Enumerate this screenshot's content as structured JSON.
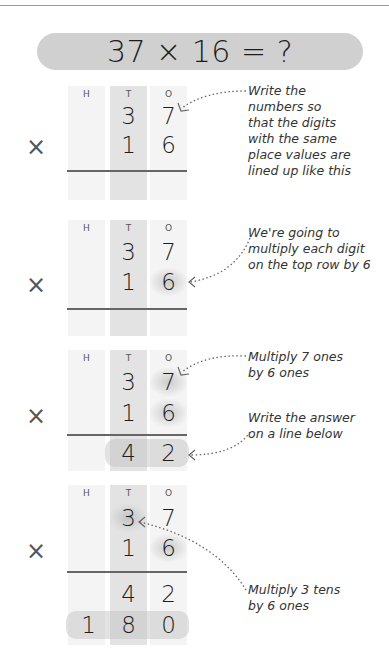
{
  "title": "37 × 16 = ?",
  "column_headers": [
    "H",
    "T",
    "O"
  ],
  "operator": "×",
  "steps": [
    {
      "rows": [
        [
          "",
          "3",
          "7"
        ],
        [
          "",
          "1",
          "6"
        ]
      ],
      "answer_rows": [],
      "note": "Write the\nnumbers so\nthat the digits\nwith the same\nplace values are\nlined up like this"
    },
    {
      "rows": [
        [
          "",
          "3",
          "7"
        ],
        [
          "",
          "1",
          "6"
        ]
      ],
      "answer_rows": [],
      "note": "We're going to\nmultiply each digit\non the top row by 6"
    },
    {
      "rows": [
        [
          "",
          "3",
          "7"
        ],
        [
          "",
          "1",
          "6"
        ]
      ],
      "answer_rows": [
        [
          "",
          "4",
          "2"
        ]
      ],
      "notes": [
        "Multiply 7 ones\nby 6 ones",
        "Write the answer\non a line below"
      ]
    },
    {
      "rows": [
        [
          "",
          "3",
          "7"
        ],
        [
          "",
          "1",
          "6"
        ]
      ],
      "answer_rows": [
        [
          "",
          "4",
          "2"
        ],
        [
          "1",
          "8",
          "0"
        ]
      ],
      "note": "Multiply 3 tens\nby 6 ones"
    }
  ],
  "colors": {
    "title_bg": "#d0d0d0",
    "col_light": "#f4f4f4",
    "col_tens": "#e3e3e3",
    "rule": "#666666",
    "text": "#1e1e1e"
  }
}
